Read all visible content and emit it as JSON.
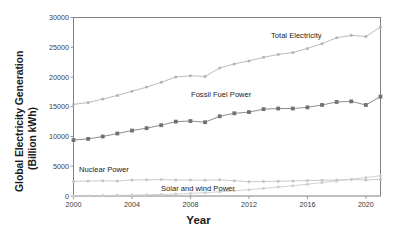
{
  "chart_data": {
    "type": "line",
    "title": "",
    "xlabel": "Year",
    "ylabel": "Global Electricity Generation (Billion kWh)",
    "ylabel_line1": "Global Electricity Generation",
    "ylabel_line2": "(Billion kWh)",
    "xlim": [
      2000,
      2021
    ],
    "ylim": [
      0,
      30000
    ],
    "grid": false,
    "legend_position": "inline-labels",
    "xticks": [
      2000,
      2004,
      2008,
      2012,
      2016,
      2020
    ],
    "yticks": [
      0,
      5000,
      10000,
      15000,
      20000,
      25000,
      30000
    ],
    "x": [
      2000,
      2001,
      2002,
      2003,
      2004,
      2005,
      2006,
      2007,
      2008,
      2009,
      2010,
      2011,
      2012,
      2013,
      2014,
      2015,
      2016,
      2017,
      2018,
      2019,
      2020,
      2021
    ],
    "series": [
      {
        "name": "Total Electricity",
        "color": "#b3b3b3",
        "marker": "circle",
        "values": [
          15400,
          15700,
          16300,
          16900,
          17600,
          18300,
          19100,
          20000,
          20200,
          20100,
          21500,
          22200,
          22700,
          23300,
          23800,
          24100,
          24800,
          25600,
          26600,
          27000,
          26800,
          28400
        ]
      },
      {
        "name": "Fossil Fuel Power",
        "color": "#808080",
        "marker": "square",
        "values": [
          9400,
          9600,
          10000,
          10500,
          11000,
          11400,
          11900,
          12500,
          12600,
          12400,
          13400,
          13900,
          14100,
          14600,
          14700,
          14700,
          14900,
          15300,
          15800,
          15900,
          15300,
          16700
        ]
      },
      {
        "name": "Nuclear Power",
        "color": "#c4c4c4",
        "marker": "circle",
        "values": [
          2450,
          2520,
          2550,
          2520,
          2690,
          2720,
          2760,
          2700,
          2680,
          2650,
          2720,
          2580,
          2400,
          2440,
          2490,
          2530,
          2590,
          2630,
          2700,
          2790,
          2680,
          2800
        ]
      },
      {
        "name": "Solar and wind Power",
        "color": "#cdcdcd",
        "marker": "circle",
        "values": [
          40,
          60,
          80,
          110,
          150,
          200,
          260,
          340,
          440,
          560,
          700,
          880,
          1060,
          1280,
          1500,
          1730,
          1980,
          2250,
          2520,
          2820,
          3100,
          3400
        ]
      }
    ],
    "series_labels": [
      {
        "text": "Total Electricity",
        "x_px": 271,
        "y_px": 31
      },
      {
        "text": "Fossil Fuel Power",
        "x_px": 191,
        "y_px": 90
      },
      {
        "text": "Nuclear Power",
        "x_px": 79,
        "y_px": 165
      },
      {
        "text": "Solar and wind Power",
        "x_px": 161,
        "y_px": 184
      }
    ]
  },
  "axis": {
    "ylabel_line1": "Global Electricity Generation",
    "ylabel_line2": "(Billion kWh)",
    "xlabel": "Year",
    "yticks": [
      "30000",
      "25000",
      "20000",
      "15000",
      "10000",
      "5000",
      "0"
    ],
    "xticks": [
      "2000",
      "2004",
      "2008",
      "2012",
      "2016",
      "2020"
    ]
  },
  "caption": ""
}
